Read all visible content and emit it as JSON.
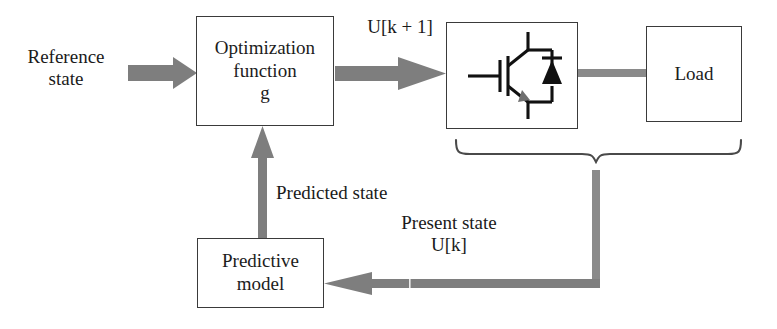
{
  "diagram": {
    "colors": {
      "arrow_gray": "#7e7e7e",
      "line_gray": "#8a8a8a",
      "box_border": "#3a3a3a",
      "text": "#1a1a1a",
      "symbol_black": "#111111",
      "background": "#ffffff"
    },
    "boxes": [
      {
        "id": "optimization",
        "label_line1": "Optimization",
        "label_line2": "function",
        "label_line3": "g"
      },
      {
        "id": "converter",
        "label": "",
        "symbol": "igbt-with-antiparallel-diode"
      },
      {
        "id": "load",
        "label": "Load"
      },
      {
        "id": "predictive",
        "label_line1": "Predictive",
        "label_line2": "model"
      }
    ],
    "labels": {
      "reference_state_line1": "Reference",
      "reference_state_line2": "state",
      "u_k_plus_1": "U[k + 1]",
      "predicted_state": "Predicted state",
      "present_state_line1": "Present state",
      "present_state_line2": "U[k]"
    },
    "connectors": [
      {
        "name": "reference-to-optimization",
        "kind": "block-arrow",
        "direction": "right"
      },
      {
        "name": "optimization-to-converter",
        "kind": "block-arrow",
        "direction": "right"
      },
      {
        "name": "converter-to-load",
        "kind": "plain-bar",
        "direction": "right"
      },
      {
        "name": "feedback-to-predictive",
        "kind": "block-arrow",
        "direction": "left"
      },
      {
        "name": "predictive-to-optimization",
        "kind": "block-arrow",
        "direction": "up"
      },
      {
        "name": "measurement-brace",
        "kind": "curly-brace",
        "direction": "down"
      },
      {
        "name": "brace-drop-line",
        "kind": "plain-bar",
        "direction": "down"
      }
    ]
  }
}
